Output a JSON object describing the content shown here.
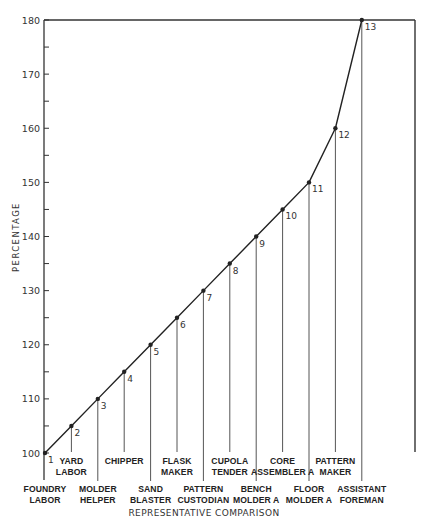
{
  "chart_data": {
    "type": "line",
    "title": "",
    "xlabel": "REPRESENTATIVE COMPARISON",
    "ylabel": "PERCENTAGE",
    "ylim": [
      100,
      180
    ],
    "yticks_major": [
      100,
      110,
      120,
      130,
      140,
      150,
      160,
      170,
      180
    ],
    "yticks_minor": [
      105,
      115,
      125,
      135,
      145,
      155,
      165,
      175
    ],
    "grid": false,
    "legend": null,
    "points": [
      {
        "index": 1,
        "label": "FOUNDRY LABOR",
        "lines": [
          "FOUNDRY",
          "LABOR"
        ],
        "value": 100,
        "row": 2
      },
      {
        "index": 2,
        "label": "YARD LABOR",
        "lines": [
          "YARD",
          "LABOR"
        ],
        "value": 105,
        "row": 1
      },
      {
        "index": 3,
        "label": "MOLDER HELPER",
        "lines": [
          "MOLDER",
          "HELPER"
        ],
        "value": 110,
        "row": 2
      },
      {
        "index": 4,
        "label": "CHIPPER",
        "lines": [
          "CHIPPER"
        ],
        "value": 115,
        "row": 1
      },
      {
        "index": 5,
        "label": "SAND BLASTER",
        "lines": [
          "SAND",
          "BLASTER"
        ],
        "value": 120,
        "row": 2
      },
      {
        "index": 6,
        "label": "FLASK MAKER",
        "lines": [
          "FLASK",
          "MAKER"
        ],
        "value": 125,
        "row": 1
      },
      {
        "index": 7,
        "label": "PATTERN CUSTODIAN",
        "lines": [
          "PATTERN",
          "CUSTODIAN"
        ],
        "value": 130,
        "row": 2
      },
      {
        "index": 8,
        "label": "CUPOLA TENDER",
        "lines": [
          "CUPOLA",
          "TENDER"
        ],
        "value": 135,
        "row": 1
      },
      {
        "index": 9,
        "label": "BENCH MOLDER A",
        "lines": [
          "BENCH",
          "MOLDER  A"
        ],
        "value": 140,
        "row": 2
      },
      {
        "index": 10,
        "label": "CORE ASSEMBLER A",
        "lines": [
          "CORE",
          "ASSEMBLER  A"
        ],
        "value": 145,
        "row": 1
      },
      {
        "index": 11,
        "label": "FLOOR MOLDER A",
        "lines": [
          "FLOOR",
          "MOLDER  A"
        ],
        "value": 150,
        "row": 2
      },
      {
        "index": 12,
        "label": "PATTERN MAKER",
        "lines": [
          "PATTERN",
          "MAKER"
        ],
        "value": 160,
        "row": 1
      },
      {
        "index": 13,
        "label": "ASSISTANT FOREMAN",
        "lines": [
          "ASSISTANT",
          "FOREMAN"
        ],
        "value": 180,
        "row": 2
      }
    ],
    "colors": {
      "line": "#222222",
      "axis": "#333333",
      "text": "#222222"
    }
  }
}
